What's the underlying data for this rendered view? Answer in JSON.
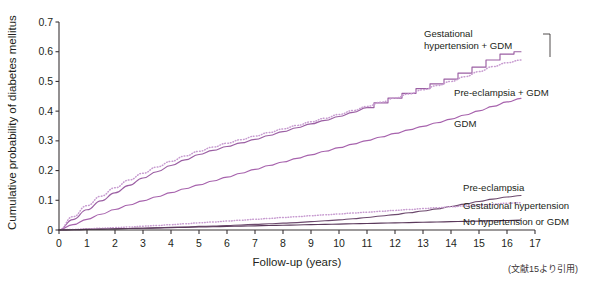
{
  "credit": "(文献15より引用)",
  "chart_data": {
    "type": "line",
    "title": "",
    "xlabel": "Follow-up  (years)",
    "ylabel": "Cumulative probability of diabetes mellitus",
    "xlim": [
      0,
      17
    ],
    "ylim": [
      0,
      0.7
    ],
    "xticks": [
      "0",
      "1",
      "2",
      "3",
      "4",
      "5",
      "6",
      "7",
      "8",
      "9",
      "10",
      "11",
      "12",
      "13",
      "14",
      "15",
      "16",
      "17"
    ],
    "yticks": [
      "0",
      "0.1",
      "0.2",
      "0.3",
      "0.4",
      "0.5",
      "0.6",
      "0.7"
    ],
    "grid": false,
    "legend_position": "inline-annotations",
    "x": [
      0,
      0.5,
      1,
      1.5,
      2,
      2.5,
      3,
      3.5,
      4,
      4.5,
      5,
      5.5,
      6,
      6.5,
      7,
      7.5,
      8,
      8.5,
      9,
      9.5,
      10,
      10.5,
      11,
      11.5,
      12,
      12.5,
      13,
      13.5,
      14,
      14.5,
      15,
      15.5,
      16,
      16.5
    ],
    "series": [
      {
        "name": "Gestational hypertension + GDM",
        "color": "#9b5fa3",
        "style": "solid",
        "label_x": 14.0,
        "label_y": 0.655,
        "values": [
          0,
          0.035,
          0.068,
          0.098,
          0.125,
          0.15,
          0.175,
          0.196,
          0.217,
          0.236,
          0.254,
          0.268,
          0.281,
          0.293,
          0.305,
          0.318,
          0.331,
          0.344,
          0.357,
          0.369,
          0.382,
          0.396,
          0.412,
          0.428,
          0.444,
          0.46,
          0.476,
          0.492,
          0.508,
          0.528,
          0.548,
          0.572,
          0.592,
          0.6
        ]
      },
      {
        "name": "Pre-eclampsia + GDM",
        "color": "#c79bd0",
        "style": "dotted",
        "label_x": 14.0,
        "label_y": 0.455,
        "values": [
          0,
          0.045,
          0.082,
          0.114,
          0.142,
          0.168,
          0.191,
          0.212,
          0.231,
          0.249,
          0.265,
          0.279,
          0.292,
          0.304,
          0.316,
          0.328,
          0.34,
          0.352,
          0.364,
          0.376,
          0.389,
          0.402,
          0.416,
          0.43,
          0.444,
          0.458,
          0.472,
          0.486,
          0.5,
          0.516,
          0.533,
          0.55,
          0.563,
          0.572
        ]
      },
      {
        "name": "GDM",
        "color": "#a763ad",
        "style": "solid",
        "label_x": 14.0,
        "label_y": 0.345,
        "values": [
          0,
          0.018,
          0.036,
          0.053,
          0.069,
          0.084,
          0.098,
          0.112,
          0.126,
          0.139,
          0.152,
          0.165,
          0.178,
          0.191,
          0.204,
          0.217,
          0.229,
          0.241,
          0.253,
          0.265,
          0.277,
          0.289,
          0.301,
          0.313,
          0.325,
          0.337,
          0.349,
          0.361,
          0.373,
          0.387,
          0.401,
          0.416,
          0.431,
          0.443
        ]
      },
      {
        "name": "Pre-eclampsia",
        "color": "#6d4a6e",
        "style": "solid",
        "label_x": 14.0,
        "label_y": 0.145,
        "values": [
          0,
          0.001,
          0.002,
          0.003,
          0.004,
          0.005,
          0.006,
          0.007,
          0.009,
          0.01,
          0.012,
          0.013,
          0.015,
          0.017,
          0.019,
          0.021,
          0.023,
          0.025,
          0.028,
          0.031,
          0.034,
          0.038,
          0.042,
          0.047,
          0.052,
          0.058,
          0.064,
          0.071,
          0.079,
          0.087,
          0.096,
          0.104,
          0.111,
          0.116
        ]
      },
      {
        "name": "Gestational hypertension",
        "color": "#c79bd0",
        "style": "dotted",
        "label_x": 14.0,
        "label_y": 0.095,
        "values": [
          0,
          0.002,
          0.004,
          0.006,
          0.008,
          0.01,
          0.013,
          0.015,
          0.018,
          0.021,
          0.024,
          0.027,
          0.03,
          0.033,
          0.036,
          0.039,
          0.042,
          0.045,
          0.048,
          0.051,
          0.054,
          0.057,
          0.06,
          0.063,
          0.066,
          0.069,
          0.072,
          0.075,
          0.078,
          0.081,
          0.084,
          0.087,
          0.09,
          0.092
        ]
      },
      {
        "name": "No hypertension or GDM",
        "color": "#5b3a5c",
        "style": "solid",
        "label_x": 14.0,
        "label_y": 0.048,
        "values": [
          0,
          0.001,
          0.002,
          0.003,
          0.004,
          0.005,
          0.006,
          0.007,
          0.008,
          0.009,
          0.01,
          0.011,
          0.012,
          0.013,
          0.014,
          0.015,
          0.016,
          0.017,
          0.018,
          0.019,
          0.02,
          0.021,
          0.022,
          0.023,
          0.024,
          0.025,
          0.026,
          0.027,
          0.028,
          0.029,
          0.03,
          0.031,
          0.032,
          0.033
        ]
      }
    ],
    "annotations": [
      {
        "text_line1": "Gestational",
        "text_line2": "hypertension + GDM",
        "series": "Gestational hypertension + GDM"
      },
      {
        "text_line1": "Pre-eclampsia + GDM",
        "text_line2": "",
        "series": "Pre-eclampsia + GDM"
      },
      {
        "text_line1": "GDM",
        "text_line2": "",
        "series": "GDM"
      },
      {
        "text_line1": "Pre-eclampsia",
        "text_line2": "",
        "series": "Pre-eclampsia"
      },
      {
        "text_line1": "Gestational hypertension",
        "text_line2": "",
        "series": "Gestational hypertension"
      },
      {
        "text_line1": "No hypertension or GDM",
        "text_line2": "",
        "series": "No hypertension or GDM"
      }
    ]
  }
}
